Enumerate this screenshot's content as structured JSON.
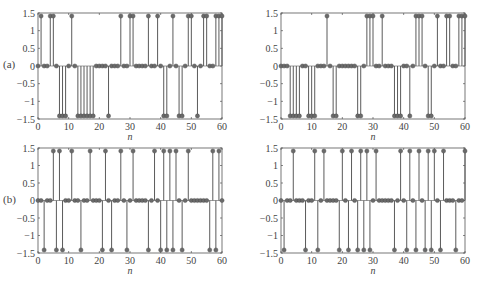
{
  "figure": {
    "row_labels": [
      "(a)",
      "(b)"
    ],
    "xlabel": "n"
  },
  "chart_data": [
    {
      "type": "stem",
      "id": "a-left",
      "row_label": "(a)",
      "xlabel": "n",
      "ylabel": "",
      "xlim": [
        0,
        60
      ],
      "ylim": [
        -1.5,
        1.5
      ],
      "xticks": [
        0,
        10,
        20,
        30,
        40,
        50,
        60
      ],
      "yticks": [
        -1.5,
        -1,
        -0.5,
        0,
        0.5,
        1,
        1.5
      ],
      "ytick_labels": [
        "−1.5",
        "−1",
        "−0.5",
        "0",
        "0.5",
        "1",
        "1.5"
      ],
      "amplitude": 1.414,
      "positive_n": [
        1,
        4,
        5,
        11,
        27,
        30,
        31,
        36,
        39,
        44,
        49,
        50,
        54,
        55,
        58,
        59,
        60
      ],
      "negative_n": [
        7,
        8,
        9,
        13,
        14,
        15,
        16,
        17,
        18,
        23,
        41,
        42,
        46,
        47,
        52
      ]
    },
    {
      "type": "stem",
      "id": "a-right",
      "row_label": "",
      "xlabel": "n",
      "ylabel": "",
      "xlim": [
        0,
        60
      ],
      "ylim": [
        -1.5,
        1.5
      ],
      "xticks": [
        0,
        10,
        20,
        30,
        40,
        50,
        60
      ],
      "yticks": [
        -1.5,
        -1,
        -0.5,
        0,
        0.5,
        1,
        1.5
      ],
      "ytick_labels": [
        "−1.5",
        "−1",
        "−0.5",
        "0",
        "0.5",
        "1",
        "1.5"
      ],
      "amplitude": 1.414,
      "positive_n": [
        15,
        28,
        29,
        30,
        33,
        44,
        45,
        46,
        51,
        54,
        55,
        58,
        59,
        60
      ],
      "negative_n": [
        3,
        4,
        5,
        6,
        9,
        10,
        11,
        17,
        18,
        25,
        26,
        37,
        38,
        39,
        42,
        48,
        49
      ]
    },
    {
      "type": "stem",
      "id": "b-left",
      "row_label": "(b)",
      "xlabel": "n",
      "ylabel": "",
      "xlim": [
        0,
        60
      ],
      "ylim": [
        -1.5,
        1.5
      ],
      "xticks": [
        0,
        10,
        20,
        30,
        40,
        50,
        60
      ],
      "yticks": [
        -1.5,
        -1,
        -0.5,
        0,
        0.5,
        1,
        1.5
      ],
      "ytick_labels": [
        "−1.5",
        "−1",
        "−0.5",
        "0",
        "0.5",
        "1",
        "1.5"
      ],
      "amplitude": 1.414,
      "positive_n": [
        5,
        7,
        11,
        17,
        22,
        27,
        31,
        38,
        41,
        43,
        45,
        49,
        57,
        59
      ],
      "negative_n": [
        2,
        6,
        8,
        14,
        21,
        24,
        29,
        36,
        40,
        42,
        44,
        47,
        56,
        58
      ]
    },
    {
      "type": "stem",
      "id": "b-right",
      "row_label": "",
      "xlabel": "n",
      "ylabel": "",
      "xlim": [
        0,
        60
      ],
      "ylim": [
        -1.5,
        1.5
      ],
      "xticks": [
        0,
        10,
        20,
        30,
        40,
        50,
        60
      ],
      "yticks": [
        -1.5,
        -1,
        -0.5,
        0,
        0.5,
        1,
        1.5
      ],
      "ytick_labels": [
        "−1.5",
        "−1",
        "−0.5",
        "0",
        "0.5",
        "1",
        "1.5"
      ],
      "amplitude": 1.414,
      "positive_n": [
        4,
        11,
        14,
        20,
        23,
        26,
        28,
        31,
        39,
        42,
        45,
        48,
        50,
        53,
        60
      ],
      "negative_n": [
        1,
        8,
        12,
        19,
        22,
        25,
        27,
        29,
        37,
        41,
        44,
        47,
        49,
        52,
        57
      ]
    }
  ],
  "style": {
    "stem_color": "#5a5a5a",
    "marker_color": "#6a6a6a",
    "axis_color": "#555555"
  }
}
